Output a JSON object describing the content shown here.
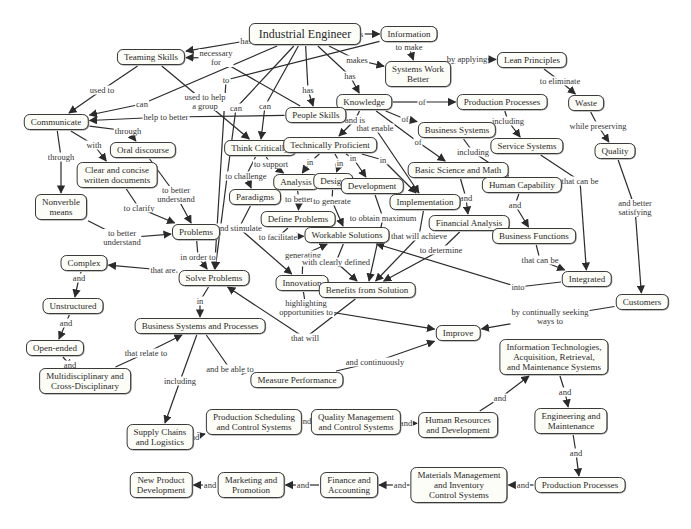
{
  "colors": {
    "node_border": "#3a3a3a",
    "node_fill": "#fdfdf8",
    "edge": "#2b2b2b",
    "text": "#2a2a2a"
  },
  "nodes": [
    {
      "id": "ie",
      "text": "Industrial Engineer",
      "x": 305,
      "y": 34,
      "big": true
    },
    {
      "id": "info",
      "text": "Information",
      "x": 409,
      "y": 34
    },
    {
      "id": "teaming",
      "text": "Teaming Skills",
      "x": 151,
      "y": 57
    },
    {
      "id": "swb",
      "text": "Systems Work\nBetter",
      "x": 418,
      "y": 74
    },
    {
      "id": "lean",
      "text": "Lean Principles",
      "x": 532,
      "y": 60
    },
    {
      "id": "waste",
      "text": "Waste",
      "x": 586,
      "y": 103
    },
    {
      "id": "knowledge",
      "text": "Knowledge",
      "x": 364,
      "y": 102
    },
    {
      "id": "prodproc1",
      "text": "Production Processes",
      "x": 502,
      "y": 102
    },
    {
      "id": "people",
      "text": "People Skills",
      "x": 316,
      "y": 115
    },
    {
      "id": "communicate",
      "text": "Communicate",
      "x": 56,
      "y": 122
    },
    {
      "id": "oral",
      "text": "Oral discourse",
      "x": 143,
      "y": 150
    },
    {
      "id": "thinkcrit",
      "text": "Think Critically",
      "x": 260,
      "y": 148
    },
    {
      "id": "techprof",
      "text": "Technically Proficient",
      "x": 330,
      "y": 145
    },
    {
      "id": "bizsys",
      "text": "Business Systems",
      "x": 457,
      "y": 130
    },
    {
      "id": "service",
      "text": "Service Systems",
      "x": 527,
      "y": 146
    },
    {
      "id": "quality",
      "text": "Quality",
      "x": 615,
      "y": 151
    },
    {
      "id": "clear",
      "text": "Clear and concise\nwritten documents",
      "x": 117,
      "y": 175
    },
    {
      "id": "basicsci",
      "text": "Basic Science and Math",
      "x": 458,
      "y": 170
    },
    {
      "id": "analysis",
      "text": "Analysis",
      "x": 296,
      "y": 182
    },
    {
      "id": "design",
      "text": "Design",
      "x": 333,
      "y": 181
    },
    {
      "id": "development",
      "text": "Development",
      "x": 372,
      "y": 186
    },
    {
      "id": "paradigms",
      "text": "Paradigms",
      "x": 255,
      "y": 197
    },
    {
      "id": "humancap",
      "text": "Human Capability",
      "x": 522,
      "y": 185
    },
    {
      "id": "implementation",
      "text": "Implementation",
      "x": 425,
      "y": 202
    },
    {
      "id": "nonverbal",
      "text": "Nonverble\nmeans",
      "x": 61,
      "y": 207
    },
    {
      "id": "defineprob",
      "text": "Define Problems",
      "x": 298,
      "y": 219
    },
    {
      "id": "finanalysis",
      "text": "Financial Analysis",
      "x": 469,
      "y": 223
    },
    {
      "id": "bizfunc",
      "text": "Business Functions",
      "x": 534,
      "y": 236
    },
    {
      "id": "problems",
      "text": "Problems",
      "x": 196,
      "y": 232
    },
    {
      "id": "workable",
      "text": "Workable Solutions",
      "x": 347,
      "y": 235
    },
    {
      "id": "complex",
      "text": "Complex",
      "x": 84,
      "y": 263
    },
    {
      "id": "solve",
      "text": "Solve Problems",
      "x": 214,
      "y": 278
    },
    {
      "id": "innovation",
      "text": "Innovation",
      "x": 302,
      "y": 283
    },
    {
      "id": "benefits",
      "text": "Benefits from Solution",
      "x": 367,
      "y": 290
    },
    {
      "id": "integrated",
      "text": "Integrated",
      "x": 587,
      "y": 279
    },
    {
      "id": "customers",
      "text": "Customers",
      "x": 642,
      "y": 302
    },
    {
      "id": "unstructured",
      "text": "Unstructured",
      "x": 73,
      "y": 306
    },
    {
      "id": "bsp",
      "text": "Business Systems and Processes",
      "x": 200,
      "y": 326
    },
    {
      "id": "improve",
      "text": "Improve",
      "x": 458,
      "y": 333
    },
    {
      "id": "openended",
      "text": "Open-ended",
      "x": 55,
      "y": 348
    },
    {
      "id": "infotech",
      "text": "Information Technologies,\nAcquisition, Retrieval,\nand Maintenance Systems",
      "x": 554,
      "y": 357
    },
    {
      "id": "measure",
      "text": "Measure Performance",
      "x": 297,
      "y": 380
    },
    {
      "id": "multi",
      "text": "Multidisciplinary and\nCross-Disciplinary",
      "x": 85,
      "y": 381
    },
    {
      "id": "supply",
      "text": "Supply Chains\nand Logistics",
      "x": 160,
      "y": 437
    },
    {
      "id": "prodsched",
      "text": "Production Scheduling\nand Control Systems",
      "x": 254,
      "y": 422
    },
    {
      "id": "qualmgmt",
      "text": "Quality Management\nand Control Systems",
      "x": 356,
      "y": 422
    },
    {
      "id": "hrd",
      "text": "Human Resources\nand Development",
      "x": 458,
      "y": 425
    },
    {
      "id": "engmaint",
      "text": "Engineering and\nMaintenance",
      "x": 571,
      "y": 421
    },
    {
      "id": "matmgmt",
      "text": "Materials Management\nand Inventory\nControl Systems",
      "x": 459,
      "y": 485
    },
    {
      "id": "prodproc2",
      "text": "Production Processes",
      "x": 580,
      "y": 485
    },
    {
      "id": "newprod",
      "text": "New Product\nDevelopment",
      "x": 161,
      "y": 485
    },
    {
      "id": "marketing",
      "text": "Marketing and\nPromotion",
      "x": 251,
      "y": 485
    },
    {
      "id": "finance",
      "text": "Finance and\nAccounting",
      "x": 349,
      "y": 485
    }
  ],
  "links": [
    {
      "from": "ie",
      "to": "teaming",
      "label": "has",
      "lx": 246,
      "ly": 41
    },
    {
      "from": "ie",
      "to": "info",
      "label": "uses",
      "lx": 356,
      "ly": 34
    },
    {
      "from": "ie",
      "to": "swb",
      "label": "makes",
      "lx": 357,
      "ly": 60
    },
    {
      "from": "ie",
      "to": "knowledge",
      "label": "has",
      "lx": 350,
      "ly": 76
    },
    {
      "from": "ie",
      "to": "people",
      "label": "has",
      "lx": 308,
      "ly": 90
    },
    {
      "from": "ie",
      "to": "communicate",
      "label": "can",
      "lx": 142,
      "ly": 104
    },
    {
      "from": "ie",
      "to": "thinkcrit",
      "label": "can",
      "lx": 265,
      "ly": 106
    },
    {
      "from": "ie",
      "to": "solve",
      "label": "can",
      "lx": 236,
      "ly": 108
    },
    {
      "from": "info",
      "to": "solve",
      "label": "to",
      "lx": 226,
      "ly": 80
    },
    {
      "from": "info",
      "to": "swb",
      "label": "to make",
      "lx": 409,
      "ly": 47
    },
    {
      "from": "people",
      "to": "teaming",
      "label": "necessary\nfor",
      "lx": 216,
      "ly": 58
    },
    {
      "from": "teaming",
      "to": "communicate",
      "label": "used to",
      "lx": 102,
      "ly": 90
    },
    {
      "from": "teaming",
      "to": "thinkcrit",
      "label": "used to help\na group",
      "lx": 205,
      "ly": 102
    },
    {
      "from": "people",
      "to": "communicate",
      "label": "help to better",
      "lx": 166,
      "ly": 117
    },
    {
      "from": "swb",
      "to": "lean",
      "label": "by applying",
      "lx": 467,
      "ly": 59
    },
    {
      "from": "lean",
      "to": "waste",
      "label": "to eliminate",
      "lx": 560,
      "ly": 81
    },
    {
      "from": "waste",
      "to": "quality",
      "label": "while preserving",
      "lx": 598,
      "ly": 126
    },
    {
      "from": "quality",
      "to": "customers",
      "label": "and better\nsatisfying",
      "lx": 635,
      "ly": 208
    },
    {
      "from": "knowledge",
      "to": "prodproc1",
      "label": "of",
      "lx": 422,
      "ly": 102
    },
    {
      "from": "knowledge",
      "to": "bizsys",
      "label": "of",
      "lx": 405,
      "ly": 119
    },
    {
      "from": "knowledge",
      "to": "basicsci",
      "label": "of",
      "lx": 418,
      "ly": 142
    },
    {
      "from": "knowledge",
      "to": "techprof",
      "label": "and is",
      "lx": 355,
      "ly": 120
    },
    {
      "from": "people",
      "to": "implementation",
      "label": "that enable",
      "lx": 375,
      "ly": 128
    },
    {
      "from": "prodproc1",
      "to": "service",
      "label": "including",
      "lx": 508,
      "ly": 121
    },
    {
      "from": "bizsys",
      "to": "humancap",
      "label": "including",
      "lx": 473,
      "ly": 152
    },
    {
      "from": "service",
      "to": "integrated",
      "label": "that can be",
      "lx": 580,
      "ly": 181
    },
    {
      "from": "humancap",
      "to": "bizfunc",
      "label": "and",
      "lx": 515,
      "ly": 205
    },
    {
      "from": "bizfunc",
      "to": "integrated",
      "label": "that can be",
      "lx": 540,
      "ly": 260
    },
    {
      "from": "basicsci",
      "to": "finanalysis",
      "label": "and",
      "lx": 466,
      "ly": 198
    },
    {
      "from": "communicate",
      "to": "oral",
      "label": "through",
      "lx": 128,
      "ly": 131
    },
    {
      "from": "communicate",
      "to": "clear",
      "label": "with",
      "lx": 94,
      "ly": 145
    },
    {
      "from": "communicate",
      "to": "nonverbal",
      "label": "through",
      "lx": 61,
      "ly": 157
    },
    {
      "from": "oral",
      "to": "problems",
      "label": "to better\nunderstand",
      "lx": 176,
      "ly": 195
    },
    {
      "from": "clear",
      "to": "problems",
      "label": "to clarify",
      "lx": 139,
      "ly": 208
    },
    {
      "from": "nonverbal",
      "to": "problems",
      "label": "to better\nunderstand",
      "lx": 122,
      "ly": 238
    },
    {
      "from": "thinkcrit",
      "to": "analysis",
      "label": "to support",
      "lx": 271,
      "ly": 164
    },
    {
      "from": "thinkcrit",
      "to": "paradigms",
      "label": "to challenge",
      "lx": 246,
      "ly": 176
    },
    {
      "from": "techprof",
      "to": "analysis",
      "label": "in",
      "lx": 310,
      "ly": 162
    },
    {
      "from": "techprof",
      "to": "design",
      "label": "in",
      "lx": 340,
      "ly": 163
    },
    {
      "from": "techprof",
      "to": "development",
      "label": "in",
      "lx": 353,
      "ly": 158
    },
    {
      "from": "techprof",
      "to": "implementation",
      "label": "in",
      "lx": 383,
      "ly": 160
    },
    {
      "from": "analysis",
      "to": "defineprob",
      "label": "to better",
      "lx": 299,
      "ly": 199
    },
    {
      "from": "design",
      "to": "workable",
      "label": "to generate",
      "lx": 332,
      "ly": 201
    },
    {
      "from": "development",
      "to": "benefits",
      "label": "to obtain maximum",
      "lx": 383,
      "ly": 218
    },
    {
      "from": "paradigms",
      "to": "innovation",
      "label": "and stimulate",
      "lx": 239,
      "ly": 228
    },
    {
      "from": "defineprob",
      "to": "workable",
      "label": "to facilitate",
      "lx": 278,
      "ly": 237
    },
    {
      "from": "innovation",
      "to": "workable",
      "label": "generating",
      "lx": 303,
      "ly": 255
    },
    {
      "from": "workable",
      "to": "benefits",
      "label": "with clearly defined",
      "lx": 336,
      "ly": 262
    },
    {
      "from": "implementation",
      "to": "benefits",
      "label": "that will achieve",
      "lx": 419,
      "ly": 236
    },
    {
      "from": "finanalysis",
      "to": "benefits",
      "label": "to determine",
      "lx": 441,
      "ly": 250
    },
    {
      "from": "integrated",
      "to": "workable",
      "label": "into",
      "lx": 518,
      "ly": 287
    },
    {
      "from": "problems",
      "to": "solve",
      "label": "in order to",
      "lx": 198,
      "ly": 257
    },
    {
      "from": "solve",
      "to": "complex",
      "label": "that are",
      "lx": 163,
      "ly": 270
    },
    {
      "from": "benefits",
      "to": "solve",
      "label": "that will",
      "lx": 305,
      "ly": 338
    },
    {
      "from": "innovation",
      "to": "improve",
      "label": "highlighting\nopportunities to",
      "lx": 306,
      "ly": 308
    },
    {
      "from": "customers",
      "to": "improve",
      "label": "by continually seeking\nways to",
      "lx": 550,
      "ly": 317
    },
    {
      "from": "complex",
      "to": "unstructured",
      "label": "and",
      "lx": 79,
      "ly": 278
    },
    {
      "from": "unstructured",
      "to": "openended",
      "label": "and",
      "lx": 66,
      "ly": 323
    },
    {
      "from": "openended",
      "to": "multi",
      "label": "and",
      "lx": 70,
      "ly": 365
    },
    {
      "from": "multi",
      "to": "bsp",
      "label": "that relate to",
      "lx": 146,
      "ly": 353
    },
    {
      "from": "solve",
      "to": "bsp",
      "label": "in",
      "lx": 200,
      "ly": 301
    },
    {
      "from": "bsp",
      "to": "measure",
      "label": "and be able to",
      "lx": 230,
      "ly": 369
    },
    {
      "from": "bsp",
      "to": "supply",
      "label": "including",
      "lx": 180,
      "ly": 381
    },
    {
      "from": "measure",
      "to": "improve",
      "label": "and continuously",
      "lx": 375,
      "ly": 362
    },
    {
      "from": "supply",
      "to": "prodsched",
      "label": "and",
      "lx": 193,
      "ly": 437
    },
    {
      "from": "prodsched",
      "to": "qualmgmt",
      "label": "and",
      "lx": 305,
      "ly": 421
    },
    {
      "from": "qualmgmt",
      "to": "hrd",
      "label": "and",
      "lx": 406,
      "ly": 423
    },
    {
      "from": "hrd",
      "to": "infotech",
      "label": "and",
      "lx": 500,
      "ly": 398
    },
    {
      "from": "infotech",
      "to": "engmaint",
      "label": "and",
      "lx": 565,
      "ly": 392
    },
    {
      "from": "engmaint",
      "to": "prodproc2",
      "label": "and",
      "lx": 576,
      "ly": 453
    },
    {
      "from": "prodproc2",
      "to": "matmgmt",
      "label": "and",
      "lx": 523,
      "ly": 485
    },
    {
      "from": "matmgmt",
      "to": "finance",
      "label": "and",
      "lx": 400,
      "ly": 485
    },
    {
      "from": "finance",
      "to": "marketing",
      "label": "and",
      "lx": 303,
      "ly": 485
    },
    {
      "from": "marketing",
      "to": "newprod",
      "label": "and",
      "lx": 210,
      "ly": 485
    }
  ]
}
